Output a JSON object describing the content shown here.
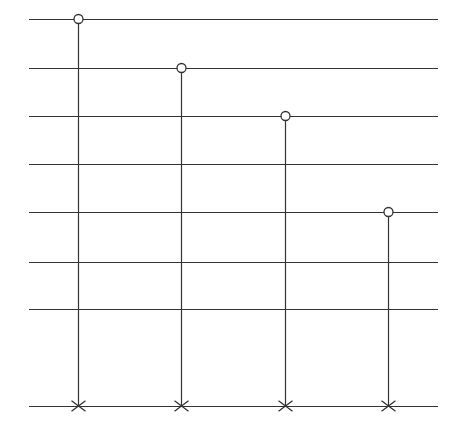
{
  "diagram": {
    "type": "stem-diagram",
    "background": "#ffffff",
    "line_color": "#333333",
    "horizontal_lines": {
      "x_start": 29,
      "x_end": 438,
      "y_positions": [
        19,
        68,
        116,
        164,
        212,
        262,
        309,
        406
      ]
    },
    "stems": [
      {
        "x": 78,
        "top_y": 19,
        "bottom_y": 406,
        "top_marker": "circle",
        "bottom_marker": "cross"
      },
      {
        "x": 181,
        "top_y": 68,
        "bottom_y": 406,
        "top_marker": "circle",
        "bottom_marker": "cross"
      },
      {
        "x": 285,
        "top_y": 116,
        "bottom_y": 406,
        "top_marker": "circle",
        "bottom_marker": "cross"
      },
      {
        "x": 388,
        "top_y": 212,
        "bottom_y": 406,
        "top_marker": "circle",
        "bottom_marker": "cross"
      }
    ],
    "circle_radius": 4.5,
    "cross_half_size": 7
  }
}
